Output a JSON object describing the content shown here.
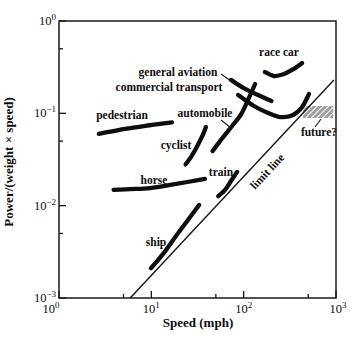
{
  "chart_data": {
    "type": "line",
    "title": "",
    "xlabel": "Speed (mph)",
    "ylabel": "Power/(weight × speed)",
    "x_scale": "log",
    "y_scale": "log",
    "xlim": [
      1,
      1000
    ],
    "ylim": [
      0.001,
      1
    ],
    "grid": false,
    "x_major_ticks": [
      1,
      10,
      100,
      1000
    ],
    "x_minor_ticks": [
      5,
      50,
      500
    ],
    "y_major_ticks": [
      1,
      0.1,
      0.01,
      0.001
    ],
    "y_minor_ticks": [
      0.5,
      0.05,
      0.005
    ],
    "x_tick_labels": [
      {
        "base": "10",
        "exp": "0"
      },
      {
        "base": "10",
        "exp": "1"
      },
      {
        "base": "10",
        "exp": "2"
      },
      {
        "base": "10",
        "exp": "3"
      }
    ],
    "y_tick_labels": [
      {
        "base": "10",
        "exp": "0"
      },
      {
        "base": "10",
        "exp": "−1"
      },
      {
        "base": "10",
        "exp": "−2"
      },
      {
        "base": "10",
        "exp": "−3"
      }
    ],
    "series": [
      {
        "name": "pedestrian",
        "points": [
          [
            2.7,
            0.06
          ],
          [
            5.2,
            0.068
          ],
          [
            10.2,
            0.075
          ],
          [
            16.7,
            0.08
          ]
        ]
      },
      {
        "name": "cyclist",
        "points": [
          [
            23.5,
            0.028
          ],
          [
            27,
            0.034
          ],
          [
            31,
            0.043
          ],
          [
            36,
            0.058
          ],
          [
            39,
            0.071
          ]
        ]
      },
      {
        "name": "horse",
        "points": [
          [
            3.9,
            0.0148
          ],
          [
            5.9,
            0.0151
          ],
          [
            9.7,
            0.0155
          ],
          [
            18,
            0.0171
          ],
          [
            38,
            0.0195
          ]
        ]
      },
      {
        "name": "ship",
        "points": [
          [
            9.9,
            0.0021
          ],
          [
            13.4,
            0.003
          ],
          [
            18.5,
            0.0047
          ],
          [
            26,
            0.0074
          ],
          [
            33,
            0.0102
          ]
        ]
      },
      {
        "name": "train",
        "points": [
          [
            53,
            0.0127
          ],
          [
            63,
            0.0148
          ],
          [
            73,
            0.0185
          ],
          [
            85,
            0.0232
          ]
        ]
      },
      {
        "name": "automobile",
        "points": [
          [
            46,
            0.039
          ],
          [
            58,
            0.053
          ],
          [
            75,
            0.073
          ],
          [
            94,
            0.098
          ],
          [
            114,
            0.147
          ],
          [
            133,
            0.208
          ]
        ]
      },
      {
        "name": "commercial transport",
        "points": [
          [
            87,
            0.158
          ],
          [
            129,
            0.12
          ],
          [
            184,
            0.101
          ],
          [
            254,
            0.091
          ],
          [
            343,
            0.096
          ],
          [
            429,
            0.117
          ],
          [
            510,
            0.162
          ]
        ]
      },
      {
        "name": "general aviation",
        "points": [
          [
            73,
            0.23
          ],
          [
            98,
            0.19
          ],
          [
            143,
            0.158
          ],
          [
            200,
            0.136
          ]
        ]
      },
      {
        "name": "race car",
        "points": [
          [
            170,
            0.28
          ],
          [
            213,
            0.254
          ],
          [
            274,
            0.267
          ],
          [
            343,
            0.3
          ],
          [
            429,
            0.35
          ]
        ]
      }
    ],
    "reference_line": {
      "name": "limit line",
      "points": [
        [
          5.9,
          0.001
        ],
        [
          950,
          0.23
        ]
      ]
    },
    "regions": [
      {
        "name": "future?",
        "x_range": [
          440,
          935
        ],
        "y_range": [
          0.089,
          0.12
        ],
        "style": "crosshatch",
        "color": "#777777"
      }
    ],
    "legend": "none",
    "ink_color": "#0e0e0e"
  }
}
